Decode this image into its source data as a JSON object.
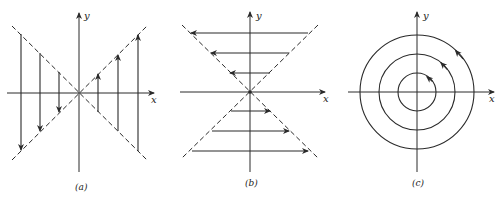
{
  "figure": {
    "panels": [
      {
        "id": "a",
        "caption": "(a)",
        "x_label": "x",
        "y_label": "y",
        "description": "Vertical trajectories between two dashed lines y=x and y=-x; left side arrows point down, right side arrows point up"
      },
      {
        "id": "b",
        "caption": "(b)",
        "x_label": "x",
        "y_label": "y",
        "description": "Horizontal trajectories between two dashed lines; upper half arrows point left, lower half arrows point right"
      },
      {
        "id": "c",
        "caption": "(c)",
        "x_label": "x",
        "y_label": "y",
        "description": "Three concentric circles centered at origin with counterclockwise arrows"
      }
    ],
    "colors": {
      "stroke": "#2a2a2a",
      "background": "#ffffff"
    }
  }
}
